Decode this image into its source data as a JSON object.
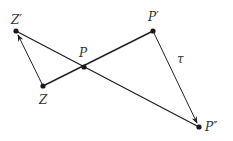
{
  "diagram": {
    "colors": {
      "line": "#222222",
      "point": "#1a1a1a",
      "label": "#333333",
      "background": "#ffffff"
    },
    "points": {
      "Zp": {
        "label": "Z′",
        "x": 16,
        "y": 31,
        "lx": 11,
        "ly": 24
      },
      "Z": {
        "label": "Z",
        "x": 43,
        "y": 86,
        "lx": 39,
        "ly": 104
      },
      "P": {
        "label": "P",
        "x": 84,
        "y": 67,
        "lx": 79,
        "ly": 57
      },
      "Pp": {
        "label": "P′",
        "x": 153,
        "y": 31,
        "lx": 148,
        "ly": 21
      },
      "Ppp": {
        "label": "P″",
        "x": 199,
        "y": 127,
        "lx": 205,
        "ly": 131
      }
    },
    "edge_label": {
      "text": "τ",
      "x": 177,
      "y": 63
    },
    "segments": [
      {
        "from": "Zp",
        "to": "Ppp",
        "arrow": false
      },
      {
        "from": "Z",
        "to": "Pp",
        "arrow": false
      },
      {
        "from": "Z",
        "to": "Zp",
        "arrow": true
      },
      {
        "from": "Pp",
        "to": "Ppp",
        "arrow": true
      }
    ]
  }
}
